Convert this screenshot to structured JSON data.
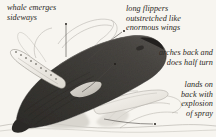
{
  "figure": {
    "background_color": "#f7f5f0",
    "ink_color": "#2b2824",
    "whale_body_color": "#3a3834",
    "pencil_line_color": "#9a9790"
  },
  "annotations": [
    {
      "id": "whale-emerges-sideways",
      "lines": [
        "whale emerges",
        "sideways"
      ],
      "dot": {
        "x": 66,
        "y": 24
      },
      "leader": "vertical line down from dot to whale back"
    },
    {
      "id": "long-flippers-outstretched",
      "lines": [
        "long flippers",
        "outstretched like",
        "enormous wings"
      ],
      "dot": {
        "x": 124,
        "y": 31
      },
      "leader": "diagonal line down-left to flipper"
    },
    {
      "id": "arches-back-half-turn",
      "lines": [
        "arches back and",
        "does half turn"
      ],
      "dot": {
        "x": 115,
        "y": 64
      },
      "leader": "diagonal line down-left to whale body"
    },
    {
      "id": "lands-on-back-explosion-of-spray",
      "lines": [
        "lands on",
        "back with",
        "explosion",
        "of spray"
      ],
      "dot": {
        "x": 155,
        "y": 124
      },
      "leader": "horizontal line left to spray"
    }
  ],
  "illustration": {
    "subject": "humpback whale breaching",
    "elements": [
      "dark arched whale body rising diagonally",
      "white scalloped pectoral flipper upper-left",
      "second flipper lower-right",
      "water spray and splash at base",
      "faint pencil arcs showing motion and spray"
    ]
  }
}
